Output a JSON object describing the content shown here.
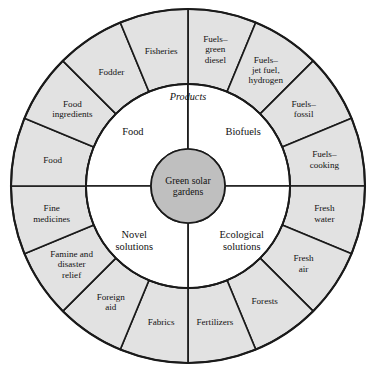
{
  "diagram": {
    "type": "concentric-wheel",
    "title_center": "Green solar gardens",
    "center": {
      "label_line1": "Green solar",
      "label_line2": "gardens"
    },
    "annotation": {
      "products_label": "Products"
    },
    "colors": {
      "outer_ring_fill": "#e2e2e2",
      "inner_ring_fill": "#ffffff",
      "hub_fill": "#bfbfbf",
      "stroke": "#1a1a1a",
      "background": "#ffffff"
    },
    "inner_ring": {
      "count": 4,
      "sectors": [
        {
          "id": "food",
          "lines": [
            "Food"
          ],
          "quadrant": "upper-left"
        },
        {
          "id": "biofuels",
          "lines": [
            "Biofuels"
          ],
          "quadrant": "upper-right"
        },
        {
          "id": "ecological-solutions",
          "lines": [
            "Ecological",
            "solutions"
          ],
          "quadrant": "lower-right"
        },
        {
          "id": "novel-solutions",
          "lines": [
            "Novel",
            "solutions"
          ],
          "quadrant": "lower-left"
        }
      ]
    },
    "outer_ring": {
      "count": 16,
      "sectors": [
        {
          "id": "fuels-green-diesel",
          "lines": [
            "Fuels–",
            "green",
            "diesel"
          ]
        },
        {
          "id": "fuels-jet-fuel-hydrogen",
          "lines": [
            "Fuels–",
            "jet fuel,",
            "hydrogen"
          ]
        },
        {
          "id": "fuels-fossil",
          "lines": [
            "Fuels–",
            "fossil"
          ]
        },
        {
          "id": "fuels-cooking",
          "lines": [
            "Fuels–",
            "cooking"
          ]
        },
        {
          "id": "fresh-water",
          "lines": [
            "Fresh",
            "water"
          ]
        },
        {
          "id": "fresh-air",
          "lines": [
            "Fresh",
            "air"
          ]
        },
        {
          "id": "forests",
          "lines": [
            "Forests"
          ]
        },
        {
          "id": "fertilizers",
          "lines": [
            "Fertilizers"
          ]
        },
        {
          "id": "fabrics",
          "lines": [
            "Fabrics"
          ]
        },
        {
          "id": "foreign-aid",
          "lines": [
            "Foreign",
            "aid"
          ]
        },
        {
          "id": "famine-and-disaster-relief",
          "lines": [
            "Famine and",
            "disaster",
            "relief"
          ]
        },
        {
          "id": "fine-medicines",
          "lines": [
            "Fine",
            "medicines"
          ]
        },
        {
          "id": "food",
          "lines": [
            "Food"
          ]
        },
        {
          "id": "food-ingredients",
          "lines": [
            "Food",
            "ingredients"
          ]
        },
        {
          "id": "fodder",
          "lines": [
            "Fodder"
          ]
        },
        {
          "id": "fisheries",
          "lines": [
            "Fisheries"
          ]
        }
      ]
    },
    "geometry": {
      "cx": 188,
      "cy": 186,
      "r_hub": 37,
      "r_inner_outer": 102,
      "r_ring_outer": 177
    }
  }
}
